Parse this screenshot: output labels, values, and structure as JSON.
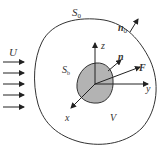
{
  "diagram": {
    "labels": {
      "outer_surface": "S",
      "outer_surface_sub": "0",
      "outer_normal": "n",
      "outer_normal_sub": "0",
      "freestream": "U",
      "body_surface": "S",
      "body_surface_sub": "b",
      "axis_z": "z",
      "axis_y": "y",
      "axis_x": "x",
      "body_normal": "n",
      "force": "F",
      "volume": "V"
    },
    "colors": {
      "line": "#333333",
      "body_fill": "#b3b3b3",
      "background": "#ffffff"
    },
    "freestream_arrow_count": 5
  }
}
